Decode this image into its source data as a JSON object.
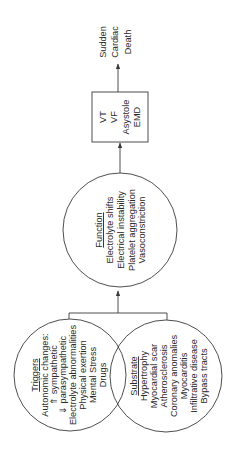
{
  "diagram": {
    "orientation": "rotated-90-ccw",
    "colors": {
      "stroke": "#3a3a3a",
      "text": "#2a2a2a",
      "background": "#ffffff"
    },
    "nodes": {
      "triggers": {
        "title": "Triggers",
        "lines": [
          "Autonomic changes:",
          "⇑ sympathetic",
          "⇓ parasympathetic",
          "Electrolyte abnormalities",
          "Physical exertion",
          "Mental Stress",
          "Drugs"
        ]
      },
      "substrate": {
        "title": "Substrate",
        "lines": [
          "Hypertrophy",
          "Myocardial scar",
          "Atherosclerosis",
          "Coronary anomalies",
          "Myocarditis",
          "Infiltrative disease",
          "Bypass tracts"
        ]
      },
      "function": {
        "title": "Function",
        "lines": [
          "Electrolyte shifts",
          "Electrical instability",
          "Platelet aggregation",
          "Vasoconstriction"
        ]
      },
      "arrhythmia": {
        "lines": [
          "VT",
          "VF",
          "Asystole",
          "EMD"
        ]
      },
      "outcome": {
        "lines": [
          "Sudden",
          "Cardiac",
          "Death"
        ]
      }
    },
    "edges": [
      {
        "from": "triggers+substrate",
        "to": "function"
      },
      {
        "from": "function",
        "to": "arrhythmia"
      },
      {
        "from": "arrhythmia",
        "to": "outcome"
      }
    ]
  }
}
